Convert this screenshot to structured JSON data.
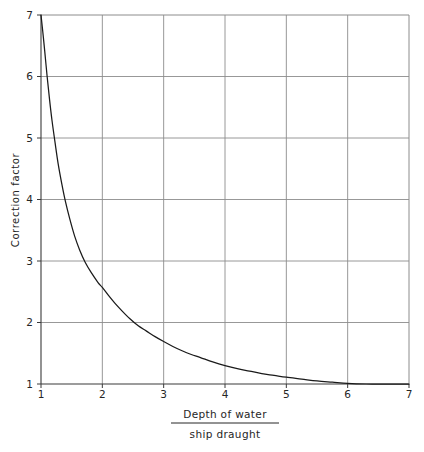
{
  "chart_data": {
    "type": "line",
    "title": "",
    "xlabel_numerator": "Depth of water",
    "xlabel_denominator": "ship draught",
    "ylabel": "Correction factor",
    "xlim": [
      1,
      7
    ],
    "ylim": [
      1,
      7
    ],
    "xticks": [
      "1",
      "2",
      "3",
      "4",
      "5",
      "6",
      "7"
    ],
    "yticks": [
      "1",
      "2",
      "3",
      "4",
      "5",
      "6",
      "7"
    ],
    "xtick_values": [
      1,
      2,
      3,
      4,
      5,
      6,
      7
    ],
    "ytick_values": [
      1,
      2,
      3,
      4,
      5,
      6,
      7
    ],
    "grid": true,
    "legend": "none",
    "series": [
      {
        "name": "Correction factor",
        "color": "#1a1a1a",
        "x": [
          1.0,
          1.03,
          1.06,
          1.1,
          1.14,
          1.18,
          1.23,
          1.28,
          1.34,
          1.4,
          1.47,
          1.55,
          1.63,
          1.72,
          1.82,
          1.93,
          2.0,
          2.1,
          2.2,
          2.32,
          2.45,
          2.58,
          2.72,
          2.86,
          3.0,
          3.15,
          3.3,
          3.45,
          3.6,
          3.8,
          4.0,
          4.2,
          4.4,
          4.6,
          4.8,
          5.0,
          5.25,
          5.5,
          5.75,
          6.0,
          6.3,
          6.6,
          7.0
        ],
        "y": [
          7.0,
          6.72,
          6.42,
          6.0,
          5.62,
          5.28,
          4.92,
          4.58,
          4.25,
          3.96,
          3.68,
          3.4,
          3.18,
          2.98,
          2.81,
          2.65,
          2.57,
          2.44,
          2.32,
          2.19,
          2.06,
          1.95,
          1.86,
          1.77,
          1.69,
          1.61,
          1.54,
          1.48,
          1.43,
          1.36,
          1.3,
          1.25,
          1.21,
          1.17,
          1.14,
          1.11,
          1.08,
          1.05,
          1.03,
          1.01,
          1.0,
          1.0,
          1.0
        ]
      }
    ],
    "annotations": []
  },
  "axes": {
    "x_label_numerator": "Depth of water",
    "x_label_denominator": "ship draught",
    "y_label": "Correction factor"
  },
  "ticks": {
    "x": [
      "1",
      "2",
      "3",
      "4",
      "5",
      "6",
      "7"
    ],
    "y": [
      "1",
      "2",
      "3",
      "4",
      "5",
      "6",
      "7"
    ]
  },
  "colors": {
    "curve": "#1a1a1a",
    "frame": "#3a3a3a",
    "grid": "#8c8c8c",
    "background": "#ffffff",
    "text": "#262626"
  }
}
